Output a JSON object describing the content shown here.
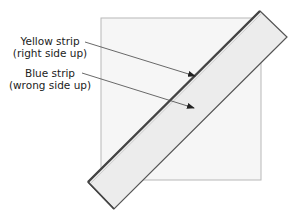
{
  "diagram": {
    "labels": {
      "yellow": {
        "line1": "Yellow strip",
        "line2": "(right side up)"
      },
      "blue": {
        "line1": "Blue strip",
        "line2": "(wrong side up)"
      }
    },
    "colors": {
      "square_fill": "#f6f6f6",
      "square_border": "#b8b8b8",
      "strip_fill": "#ececec",
      "strip_border": "#555555",
      "leader_line": "#444444",
      "text": "#222222"
    }
  }
}
